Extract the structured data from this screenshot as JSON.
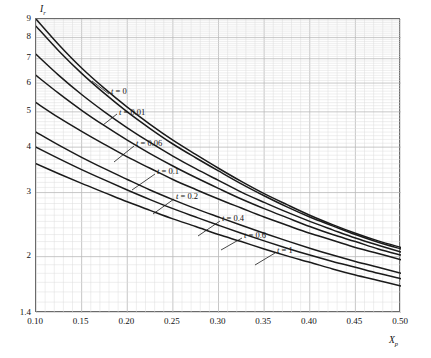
{
  "chart_data": {
    "type": "line",
    "title": "",
    "xlabel": "X_p",
    "ylabel": "I",
    "xscale": "linear",
    "yscale": "log",
    "xlim": [
      0.1,
      0.5
    ],
    "ylim": [
      1.4,
      9.0
    ],
    "grid": true,
    "grid_minor": true,
    "legend": "inline-curve-labels",
    "x_ticks": [
      "0.10",
      "0.15",
      "0.20",
      "0.25",
      "0.30",
      "0.35",
      "0.40",
      "0.45",
      "0.50"
    ],
    "x_tick_values": [
      0.1,
      0.15,
      0.2,
      0.25,
      0.3,
      0.35,
      0.4,
      0.45,
      0.5
    ],
    "y_ticks": [
      "1.4",
      "2",
      "3",
      "4",
      "5",
      "6",
      "7",
      "8",
      "9"
    ],
    "y_tick_values": [
      1.4,
      2,
      3,
      4,
      5,
      6,
      7,
      8,
      9
    ],
    "x": [
      0.1,
      0.125,
      0.15,
      0.175,
      0.2,
      0.225,
      0.25,
      0.275,
      0.3,
      0.325,
      0.35,
      0.375,
      0.4,
      0.425,
      0.45,
      0.475,
      0.5
    ],
    "series": [
      {
        "name": "t = 0",
        "label": "t = 0",
        "values": [
          9.0,
          7.65,
          6.6,
          5.8,
          5.15,
          4.62,
          4.18,
          3.82,
          3.5,
          3.22,
          2.98,
          2.78,
          2.6,
          2.45,
          2.32,
          2.21,
          2.12
        ]
      },
      {
        "name": "t = 0.01",
        "label": "t = 0.01",
        "values": [
          8.6,
          7.35,
          6.38,
          5.62,
          5.0,
          4.5,
          4.08,
          3.74,
          3.44,
          3.17,
          2.94,
          2.74,
          2.57,
          2.43,
          2.3,
          2.19,
          2.1
        ]
      },
      {
        "name": "t = 0.06",
        "label": "t = 0.06",
        "values": [
          7.2,
          6.3,
          5.58,
          5.0,
          4.52,
          4.12,
          3.78,
          3.49,
          3.24,
          3.01,
          2.82,
          2.65,
          2.5,
          2.37,
          2.25,
          2.15,
          2.06
        ]
      },
      {
        "name": "t = 0.1",
        "label": "t = 0.1",
        "values": [
          6.3,
          5.62,
          5.05,
          4.58,
          4.18,
          3.84,
          3.55,
          3.3,
          3.08,
          2.88,
          2.71,
          2.56,
          2.42,
          2.3,
          2.2,
          2.1,
          2.02
        ]
      },
      {
        "name": "t = 0.2",
        "label": "t = 0.2",
        "values": [
          5.3,
          4.82,
          4.42,
          4.07,
          3.76,
          3.5,
          3.26,
          3.06,
          2.88,
          2.72,
          2.57,
          2.44,
          2.32,
          2.22,
          2.12,
          2.04,
          1.96
        ]
      },
      {
        "name": "t = 0.4",
        "label": "t = 0.4",
        "values": [
          4.4,
          4.05,
          3.75,
          3.49,
          3.26,
          3.05,
          2.87,
          2.71,
          2.57,
          2.44,
          2.32,
          2.21,
          2.11,
          2.02,
          1.94,
          1.87,
          1.8
        ]
      },
      {
        "name": "t = 0.6",
        "label": "t = 0.6",
        "values": [
          4.0,
          3.72,
          3.47,
          3.25,
          3.05,
          2.87,
          2.71,
          2.57,
          2.44,
          2.32,
          2.21,
          2.11,
          2.02,
          1.94,
          1.87,
          1.8,
          1.74
        ]
      },
      {
        "name": "t = 1",
        "label": "t = 1",
        "values": [
          3.6,
          3.38,
          3.18,
          3.0,
          2.83,
          2.68,
          2.54,
          2.42,
          2.3,
          2.2,
          2.1,
          2.01,
          1.93,
          1.85,
          1.78,
          1.72,
          1.66
        ]
      }
    ],
    "annotations": [
      {
        "text_italic": "t",
        "text_rest": " = 0",
        "lx": 76,
        "ly": 69,
        "leader": [
          74,
          76,
          57,
          63
        ]
      },
      {
        "text_italic": "t",
        "text_rest": " = 0.01",
        "lx": 84,
        "ly": 90,
        "leader": [
          82,
          96,
          68,
          107
        ]
      },
      {
        "text_italic": "t",
        "text_rest": " = 0.06",
        "lx": 101,
        "ly": 121,
        "leader": [
          99,
          128,
          79,
          144
        ]
      },
      {
        "text_italic": "t",
        "text_rest": " = 0.1",
        "lx": 122,
        "ly": 149,
        "leader": [
          120,
          156,
          97,
          172
        ]
      },
      {
        "text_italic": "t",
        "text_rest": " = 0.2",
        "lx": 141,
        "ly": 174,
        "leader": [
          139,
          181,
          118,
          196
        ]
      },
      {
        "text_italic": "t",
        "text_rest": " = 0.4",
        "lx": 187,
        "ly": 196,
        "leader": [
          185,
          203,
          163,
          218
        ]
      },
      {
        "text_italic": "t",
        "text_rest": " = 0.6",
        "lx": 209,
        "ly": 213,
        "leader": [
          207,
          220,
          186,
          232
        ]
      },
      {
        "text_italic": "t",
        "text_rest": " = 1",
        "lx": 242,
        "ly": 228,
        "leader": [
          240,
          235,
          220,
          247
        ]
      }
    ],
    "colors": {
      "curve": "#1a1a1a",
      "major_grid": "#b9b9b9",
      "minor_grid": "#dcdcdc",
      "frame": "#6b6b6b",
      "text": "#111111",
      "background": "#ffffff"
    }
  },
  "axes": {
    "y_title_main": "I",
    "y_title_sub": "r",
    "x_title_main": "X",
    "x_title_sub": "p"
  }
}
